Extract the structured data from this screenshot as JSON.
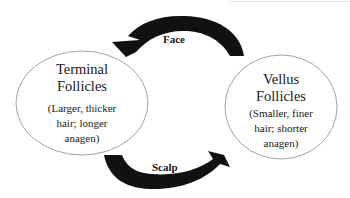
{
  "diagram": {
    "nodes": [
      {
        "id": "terminal",
        "title_line1": "Terminal",
        "title_line2": "Follicles",
        "desc_line1": "(Larger, thicker",
        "desc_line2": "hair; longer",
        "desc_line3": "anagen)"
      },
      {
        "id": "vellus",
        "title_line1": "Vellus",
        "title_line2": "Follicles",
        "desc_line1": "(Smaller, finer",
        "desc_line2": "hair; shorter",
        "desc_line3": "anagen)"
      }
    ],
    "edges": [
      {
        "from": "vellus",
        "to": "terminal",
        "label": "Face"
      },
      {
        "from": "terminal",
        "to": "vellus",
        "label": "Scalp"
      }
    ],
    "colors": {
      "arrow": "#111111",
      "ellipse_stroke": "#8a8a8a",
      "text": "#1a1a1a",
      "background": "#ffffff"
    }
  }
}
